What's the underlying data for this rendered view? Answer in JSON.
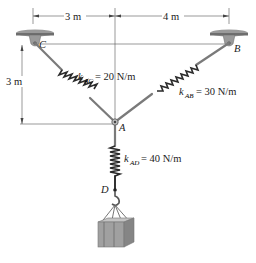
{
  "diagram": {
    "dimensions": {
      "horizontal_left": "3 m",
      "horizontal_right": "4 m",
      "vertical_left": "3 m"
    },
    "points": {
      "A": "A",
      "B": "B",
      "C": "C",
      "D": "D"
    },
    "springs": [
      {
        "k": "k",
        "sub": "AC",
        "value": "= 20 N/m"
      },
      {
        "k": "k",
        "sub": "AB",
        "value": "= 30 N/m"
      },
      {
        "k": "k",
        "sub": "AD",
        "value": "= 40 N/m"
      }
    ],
    "colors": {
      "line": "#333333",
      "spring": "#2a2a2a",
      "rod": "#777777",
      "support": "#8a8a8a",
      "box": "#9a9a9a"
    }
  }
}
